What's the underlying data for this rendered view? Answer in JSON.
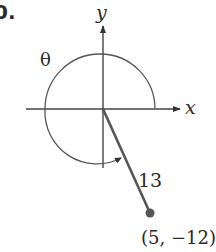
{
  "figure": {
    "problem_number": "0.",
    "axes": {
      "x_label": "x",
      "y_label": "y"
    },
    "angle_label": "θ",
    "segment_length_label": "13",
    "point_label": "(5, −12)",
    "point": {
      "x": 5,
      "y": -12
    },
    "radius": 13,
    "colors": {
      "line": "#4a4a4a",
      "axis": "#444444",
      "point": "#555555",
      "text": "#2a2a2a"
    }
  }
}
